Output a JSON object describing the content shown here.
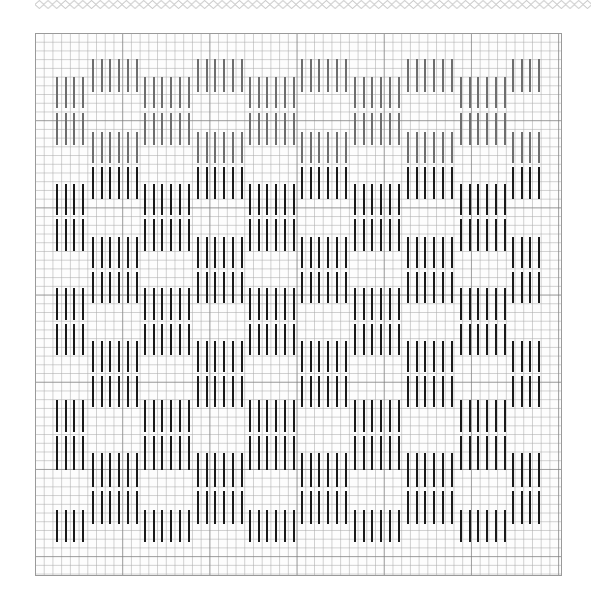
{
  "pattern": {
    "type": "needlework-chart",
    "grid": {
      "left": 35,
      "top": 33,
      "width": 527,
      "height": 543,
      "cell_px": 8.72,
      "bold_every": 10
    },
    "colors": {
      "grid_line": "#aaaaaa",
      "grid_bold": "#787878",
      "stitch_light": "#6e6e6e",
      "stitch_dark": "#1a1a1a",
      "border_chain": "#c8c8c8"
    },
    "bar_pitch": 8.7,
    "column_groups": [
      {
        "name": "low",
        "x": 57,
        "bars": 4
      },
      {
        "name": "high",
        "x": 93,
        "bars": 6
      },
      {
        "name": "low",
        "x": 145,
        "bars": 6
      },
      {
        "name": "high",
        "x": 198,
        "bars": 6
      },
      {
        "name": "low",
        "x": 250,
        "bars": 6
      },
      {
        "name": "high",
        "x": 302,
        "bars": 6
      },
      {
        "name": "low",
        "x": 355,
        "bars": 6
      },
      {
        "name": "high",
        "x": 408,
        "bars": 6
      },
      {
        "name": "low",
        "x": 461,
        "bars": 6
      },
      {
        "name": "high",
        "x": 513,
        "bars": 4
      }
    ],
    "segments": {
      "high": [
        {
          "y1": 59,
          "y2": 92,
          "tone": "gray"
        },
        {
          "y1": 132,
          "y2": 163,
          "tone": "gray"
        },
        {
          "y1": 167,
          "y2": 199,
          "tone": "black"
        },
        {
          "y1": 237,
          "y2": 268,
          "tone": "black"
        },
        {
          "y1": 272,
          "y2": 303,
          "tone": "black"
        },
        {
          "y1": 341,
          "y2": 372,
          "tone": "black"
        },
        {
          "y1": 376,
          "y2": 407,
          "tone": "black"
        },
        {
          "y1": 453,
          "y2": 487,
          "tone": "black"
        },
        {
          "y1": 491,
          "y2": 524,
          "tone": "black"
        }
      ],
      "low": [
        {
          "y1": 77,
          "y2": 108,
          "tone": "gray"
        },
        {
          "y1": 113,
          "y2": 145,
          "tone": "gray"
        },
        {
          "y1": 184,
          "y2": 215,
          "tone": "black"
        },
        {
          "y1": 219,
          "y2": 251,
          "tone": "black"
        },
        {
          "y1": 288,
          "y2": 320,
          "tone": "black"
        },
        {
          "y1": 324,
          "y2": 355,
          "tone": "black"
        },
        {
          "y1": 400,
          "y2": 432,
          "tone": "black"
        },
        {
          "y1": 436,
          "y2": 470,
          "tone": "black"
        },
        {
          "y1": 510,
          "y2": 542,
          "tone": "black"
        }
      ]
    }
  }
}
